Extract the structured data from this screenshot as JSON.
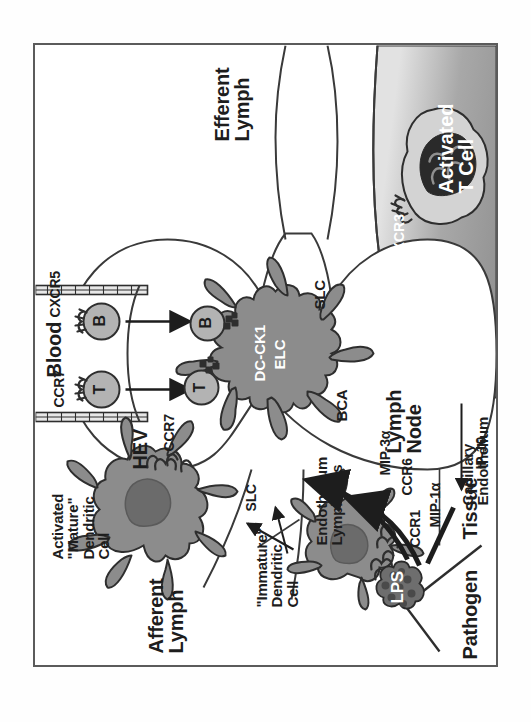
{
  "figure": {
    "border_color": "#5b5b5b"
  },
  "palette": {
    "cell_body": "#8c8c8c",
    "cell_nucleus": "#6b6b6b",
    "lymphocyte": "#b3b3b3",
    "receptor": "#2e2e2e",
    "blood_light": "#d9d9d9",
    "blood_mid": "#8f8f8f",
    "text_dark": "#1d1d1d",
    "text_light": "#ffffff",
    "outline": "#3a3a3a"
  },
  "labels": {
    "pathogen": "Pathogen",
    "lps": "LPS",
    "tissue": "Tissue",
    "ccr1": "CCR1",
    "mip1a": "MIP-1α",
    "ccr6": "CCR6",
    "mip3a": "MIP-3α",
    "ip10": "IP-10",
    "immature_dc": "\"Immature\"\nDendritic\nCell",
    "mature_dc": "Activated\n\"Mature\"\nDendritic\nCell",
    "ccr7_dc": "CCR7",
    "slc_lymphatic": "SLC",
    "endothelium_lymphatics": "Endothelium\nLymphatics",
    "afferent_lymph": "Afferent\nLymph",
    "lymph_node": "Lymph\nNode",
    "hev": "HEV",
    "blood_hev": "Blood",
    "ccr7_t": "CCR7",
    "cxcr5_b": "CXCR5",
    "t_cell": "T",
    "b_cell": "B",
    "dc_ck1": "DC-CK1",
    "elc": "ELC",
    "bca": "BCA",
    "slc_node": "SLC",
    "efferent_lymph": "Efferent\nLymph",
    "capillary_endothelium": "Capillary\nEndothelium",
    "blood_capillary": "Blood",
    "cxcr3": "CXCR3",
    "activated_t_cell": "Activated\nT Cell"
  }
}
